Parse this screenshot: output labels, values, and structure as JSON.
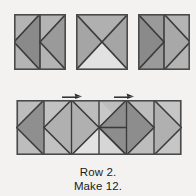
{
  "page": {
    "background": "#f3f2f0",
    "width": 196,
    "height": 196
  },
  "palette": {
    "dark_gray": "#8a8a8a",
    "medium_gray": "#9a9a9a",
    "light_gray": "#b4b4b4",
    "pale_gray": "#cfcfcf",
    "very_light_gray": "#e2e2e2",
    "seam_line": "#3b3b3b",
    "outline": "#4a4a4a",
    "text": "#1b1b1b",
    "arrow": "#2a2a2a"
  },
  "caption": {
    "line1": "Row 2.",
    "line2": "Make 12."
  },
  "top_units": [
    {
      "name": "flying-geese-left-unit",
      "x": 14,
      "y": 14,
      "width": 52,
      "height": 56,
      "description": "Two half-square units with triangles pointing left",
      "patches": [
        {
          "name": "left-square-triangle-top",
          "fill": "#b4b4b4"
        },
        {
          "name": "left-square-triangle-point",
          "fill": "#8a8a8a"
        },
        {
          "name": "right-square-triangle-top",
          "fill": "#b4b4b4"
        },
        {
          "name": "right-square-triangle-point",
          "fill": "#9a9a9a"
        }
      ]
    },
    {
      "name": "hourglass-unit",
      "x": 76,
      "y": 14,
      "width": 52,
      "height": 56,
      "description": "Quarter-square triangle hourglass block",
      "patches": [
        {
          "name": "hourglass-triangle-top",
          "fill": "#b0b0b0"
        },
        {
          "name": "hourglass-triangle-left",
          "fill": "#a5a5a5"
        },
        {
          "name": "hourglass-triangle-right",
          "fill": "#a5a5a5"
        },
        {
          "name": "hourglass-triangle-bottom",
          "fill": "#e2e2e2"
        }
      ]
    },
    {
      "name": "flying-geese-right-unit",
      "x": 138,
      "y": 14,
      "width": 52,
      "height": 56,
      "description": "Two half-square units with triangles pointing right",
      "patches": [
        {
          "name": "left-square-triangle-top",
          "fill": "#9a9a9a"
        },
        {
          "name": "left-square-triangle-point",
          "fill": "#8a8a8a"
        },
        {
          "name": "right-square-triangle-top",
          "fill": "#b4b4b4"
        },
        {
          "name": "right-square-triangle-point",
          "fill": "#a8a8a8"
        }
      ]
    }
  ],
  "row_strip": {
    "name": "assembled-row-strip",
    "x": 16,
    "y": 100,
    "width": 166,
    "height": 55,
    "segments": 6,
    "description": "Row 2 assembled from six pieced units",
    "patches": [
      {
        "name": "segment-1-point-triangle",
        "fill": "#8f8f8f"
      },
      {
        "name": "segment-1-background",
        "fill": "#bdbdbd"
      },
      {
        "name": "segment-2-diamond",
        "fill": "#b0b0b0"
      },
      {
        "name": "segment-2-background",
        "fill": "#c2c2c2"
      },
      {
        "name": "segment-3-diamond",
        "fill": "#c8c8c8"
      },
      {
        "name": "segment-3-background",
        "fill": "#bdbdbd"
      },
      {
        "name": "segment-4-lower-light",
        "fill": "#e2e2e2"
      },
      {
        "name": "segment-5-diamond",
        "fill": "#8d8d8d"
      },
      {
        "name": "segment-5-background",
        "fill": "#bdbdbd"
      },
      {
        "name": "segment-6-point-triangle",
        "fill": "#b0b0b0"
      },
      {
        "name": "segment-6-background",
        "fill": "#c6c6c6"
      }
    ]
  },
  "seam_arrows": [
    {
      "name": "seam-direction-arrow-1",
      "x": 62,
      "y": 93,
      "width": 20,
      "height": 7,
      "direction": "right"
    },
    {
      "name": "seam-direction-arrow-2",
      "x": 114,
      "y": 93,
      "width": 20,
      "height": 7,
      "direction": "right"
    }
  ]
}
